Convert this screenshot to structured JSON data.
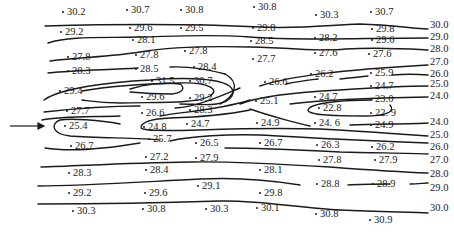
{
  "figure": {
    "type": "contour-map",
    "arrow": {
      "direction": "right",
      "label": ""
    },
    "contour_level_labels": [
      {
        "value": "30.0",
        "x": 430,
        "y": 25
      },
      {
        "value": "29.0",
        "x": 430,
        "y": 37
      },
      {
        "value": "28.0",
        "x": 430,
        "y": 49
      },
      {
        "value": "27.0",
        "x": 430,
        "y": 62
      },
      {
        "value": "26.0",
        "x": 430,
        "y": 74
      },
      {
        "value": "25.0",
        "x": 430,
        "y": 84
      },
      {
        "value": "24.0",
        "x": 430,
        "y": 96
      },
      {
        "value": "24.0",
        "x": 430,
        "y": 122
      },
      {
        "value": "25.0",
        "x": 430,
        "y": 135
      },
      {
        "value": "26.0",
        "x": 430,
        "y": 147
      },
      {
        "value": "27.0",
        "x": 430,
        "y": 160
      },
      {
        "value": "28.0",
        "x": 430,
        "y": 174
      },
      {
        "value": "29.0",
        "x": 430,
        "y": 188
      },
      {
        "value": "30.0",
        "x": 430,
        "y": 208
      }
    ],
    "points": [
      {
        "v": "30.2",
        "x": 66,
        "y": 12
      },
      {
        "v": "30.7",
        "x": 130,
        "y": 10
      },
      {
        "v": "30.8",
        "x": 184,
        "y": 10
      },
      {
        "v": "30.8",
        "x": 257,
        "y": 7
      },
      {
        "v": "30.3",
        "x": 319,
        "y": 15
      },
      {
        "v": "30.7",
        "x": 374,
        "y": 12
      },
      {
        "v": "29.2",
        "x": 64,
        "y": 32
      },
      {
        "v": "29.6",
        "x": 133,
        "y": 28
      },
      {
        "v": "29.5",
        "x": 184,
        "y": 28
      },
      {
        "v": "29.8",
        "x": 256,
        "y": 28
      },
      {
        "v": "29.8",
        "x": 375,
        "y": 29
      },
      {
        "v": "28.1",
        "x": 136,
        "y": 40
      },
      {
        "v": "28.5",
        "x": 254,
        "y": 41
      },
      {
        "v": "28.2",
        "x": 318,
        "y": 38
      },
      {
        "v": "29.6",
        "x": 375,
        "y": 40
      },
      {
        "v": "27.8",
        "x": 71,
        "y": 57
      },
      {
        "v": "27.8",
        "x": 139,
        "y": 55
      },
      {
        "v": "27.8",
        "x": 188,
        "y": 51
      },
      {
        "v": "27.7",
        "x": 256,
        "y": 59
      },
      {
        "v": "27.6",
        "x": 318,
        "y": 53
      },
      {
        "v": "27.6",
        "x": 372,
        "y": 54
      },
      {
        "v": "28.3",
        "x": 71,
        "y": 71
      },
      {
        "v": "28.5",
        "x": 139,
        "y": 69
      },
      {
        "v": "28.4",
        "x": 197,
        "y": 67
      },
      {
        "v": "26.2",
        "x": 314,
        "y": 74
      },
      {
        "v": "25.9",
        "x": 374,
        "y": 73
      },
      {
        "v": "31.5",
        "x": 155,
        "y": 81
      },
      {
        "v": "30.7",
        "x": 193,
        "y": 81
      },
      {
        "v": "29.4",
        "x": 63,
        "y": 91
      },
      {
        "v": "26.6",
        "x": 268,
        "y": 82
      },
      {
        "v": "24.7",
        "x": 374,
        "y": 86
      },
      {
        "v": "29.6",
        "x": 145,
        "y": 97
      },
      {
        "v": "29.2",
        "x": 193,
        "y": 98
      },
      {
        "v": "25.1",
        "x": 259,
        "y": 101
      },
      {
        "v": "24.7",
        "x": 318,
        "y": 97
      },
      {
        "v": "23.0",
        "x": 374,
        "y": 99
      },
      {
        "v": "27.7",
        "x": 70,
        "y": 111
      },
      {
        "v": "26.6",
        "x": 145,
        "y": 113
      },
      {
        "v": "28.3",
        "x": 193,
        "y": 110
      },
      {
        "v": "22.8",
        "x": 322,
        "y": 108
      },
      {
        "v": "22. 9",
        "x": 374,
        "y": 113
      },
      {
        "v": "25.4",
        "x": 68,
        "y": 126
      },
      {
        "v": "24.8",
        "x": 147,
        "y": 127
      },
      {
        "v": "24.7",
        "x": 190,
        "y": 124
      },
      {
        "v": "24.9",
        "x": 260,
        "y": 123
      },
      {
        "v": "24. 6",
        "x": 318,
        "y": 123
      },
      {
        "v": "24.9",
        "x": 374,
        "y": 125
      },
      {
        "v": "25.7",
        "x": 152,
        "y": 139
      },
      {
        "v": "26.7",
        "x": 74,
        "y": 146
      },
      {
        "v": "26.5",
        "x": 199,
        "y": 143
      },
      {
        "v": "26.7",
        "x": 263,
        "y": 143
      },
      {
        "v": "26.3",
        "x": 320,
        "y": 145
      },
      {
        "v": "26.2",
        "x": 375,
        "y": 147
      },
      {
        "v": "27.2",
        "x": 149,
        "y": 157
      },
      {
        "v": "27.9",
        "x": 199,
        "y": 158
      },
      {
        "v": "27.8",
        "x": 322,
        "y": 160
      },
      {
        "v": "27.9",
        "x": 378,
        "y": 160
      },
      {
        "v": "28.3",
        "x": 72,
        "y": 173
      },
      {
        "v": "28.4",
        "x": 149,
        "y": 170
      },
      {
        "v": "28.1",
        "x": 263,
        "y": 170
      },
      {
        "v": "29.1",
        "x": 201,
        "y": 186
      },
      {
        "v": "28.8",
        "x": 320,
        "y": 184
      },
      {
        "v": "28.9",
        "x": 376,
        "y": 184
      },
      {
        "v": "29.2",
        "x": 72,
        "y": 193
      },
      {
        "v": "29.6",
        "x": 148,
        "y": 193
      },
      {
        "v": "29.8",
        "x": 263,
        "y": 193
      },
      {
        "v": "30.3",
        "x": 76,
        "y": 211
      },
      {
        "v": "30.8",
        "x": 146,
        "y": 209
      },
      {
        "v": "30.3",
        "x": 209,
        "y": 209
      },
      {
        "v": "30.1",
        "x": 260,
        "y": 208
      },
      {
        "v": "30.8",
        "x": 319,
        "y": 214
      },
      {
        "v": "30.9",
        "x": 373,
        "y": 220
      }
    ]
  }
}
